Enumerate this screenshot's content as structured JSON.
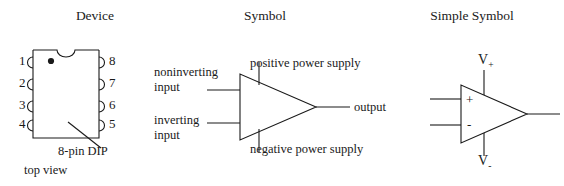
{
  "figure": {
    "background_color": "#ffffff",
    "line_color": "#1a1a1a",
    "text_color": "#1a1a1a"
  },
  "panels": {
    "device": {
      "title": "Device",
      "package_caption": "8-pin DIP",
      "view_caption": "top view",
      "pins_left": [
        "1",
        "2",
        "3",
        "4"
      ],
      "pins_right": [
        "8",
        "7",
        "6",
        "5"
      ],
      "markers": {
        "pin1_dot": "pin-one-dot",
        "notch": "package-notch"
      }
    },
    "symbol": {
      "title": "Symbol",
      "labels": {
        "noninverting_line1": "noninverting",
        "noninverting_line2": "input",
        "inverting_line1": "inverting",
        "inverting_line2": "input",
        "positive_supply": "positive power supply",
        "negative_supply": "negative power supply",
        "output": "output"
      }
    },
    "simple": {
      "title": "Simple Symbol",
      "labels": {
        "plus_input": "+",
        "minus_input": "-",
        "v_positive_base": "V",
        "v_positive_sub": "+",
        "v_negative_base": "V",
        "v_negative_sub": "-"
      }
    }
  }
}
